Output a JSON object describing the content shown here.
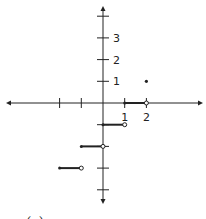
{
  "chart_data": {
    "type": "line",
    "title": "",
    "caption": "(c)",
    "xlabel": "",
    "ylabel": "",
    "xlim": [
      -4.5,
      5
    ],
    "ylim": [
      -4.5,
      4.5
    ],
    "grid": false,
    "x_ticks": [
      -2,
      -1,
      1,
      2
    ],
    "x_tick_labels": [
      {
        "value": 1,
        "label": "1"
      },
      {
        "value": 2,
        "label": "2"
      }
    ],
    "y_ticks": [
      -4,
      -3,
      -2,
      -1,
      1,
      2,
      3,
      4
    ],
    "y_tick_labels": [
      {
        "value": 1,
        "label": "1"
      },
      {
        "value": 2,
        "label": "2"
      },
      {
        "value": 3,
        "label": "3"
      }
    ],
    "segments": [
      {
        "x_start": 1,
        "x_end": 2,
        "y": 0,
        "start": "closed",
        "end": "open"
      },
      {
        "x_start": 0,
        "x_end": 1,
        "y": -1,
        "start": "closed",
        "end": "open"
      },
      {
        "x_start": -1,
        "x_end": 0,
        "y": -2,
        "start": "closed",
        "end": "open"
      },
      {
        "x_start": -2,
        "x_end": -1,
        "y": -3,
        "start": "closed",
        "end": "open"
      }
    ],
    "points": [
      {
        "x": 2,
        "y": 1,
        "style": "filled"
      }
    ]
  }
}
